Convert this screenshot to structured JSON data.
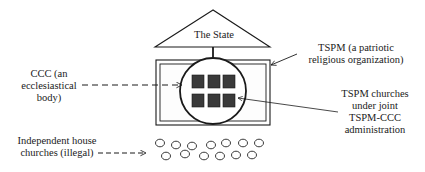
{
  "diagram": {
    "state": {
      "label": "The State"
    },
    "tspm": {
      "lines": [
        "TSPM (a patriotic",
        "religious organization)"
      ]
    },
    "ccc": {
      "lines": [
        "CCC (an",
        "ecclesiastical",
        "body)"
      ]
    },
    "tspm_churches": {
      "lines": [
        "TSPM churches",
        "under joint",
        "TSPM-CCC",
        "administration"
      ]
    },
    "house_churches": {
      "lines": [
        "Independent  house",
        "churches (illegal)"
      ]
    },
    "counts": {
      "tspm_church_squares": 6,
      "house_church_circles": 13
    },
    "colors": {
      "stroke": "#1a1a1a",
      "square_fill": "#3a3a3a",
      "background": "#ffffff"
    }
  }
}
